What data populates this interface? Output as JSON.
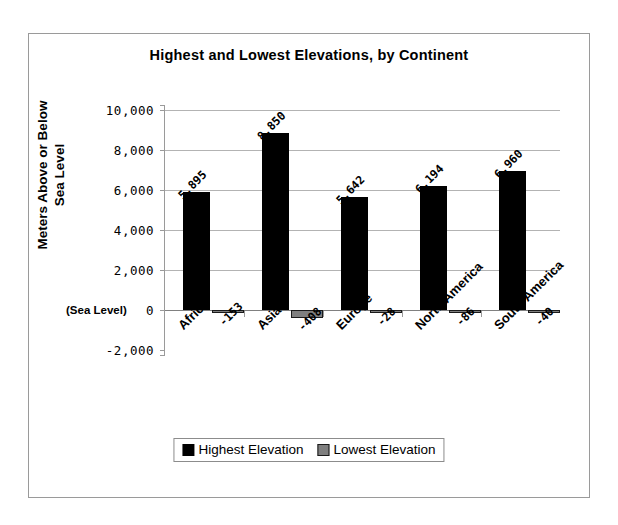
{
  "chart_data": {
    "type": "bar",
    "title": "Highest and Lowest Elevations, by Continent",
    "xlabel": "",
    "ylabel": "Meters Above or Below Sea Level",
    "categories": [
      "Africa",
      "Asia",
      "Europe",
      "North America",
      "South America"
    ],
    "series": [
      {
        "name": "Highest Elevation",
        "color": "#000000",
        "values": [
          5895,
          8850,
          5642,
          6194,
          6960
        ],
        "labels": [
          "5,895",
          "8,850",
          "5,642",
          "6,194",
          "6,960"
        ]
      },
      {
        "name": "Lowest Elevation",
        "color": "#7f7f7f",
        "values": [
          -153,
          -408,
          -28,
          -86,
          -40
        ],
        "labels": [
          "-153",
          "-408",
          "-28",
          "-86",
          "-40"
        ]
      }
    ],
    "ylim": [
      -2000,
      10000
    ],
    "ytick_values": [
      10000,
      8000,
      6000,
      4000,
      2000,
      0,
      -2000
    ],
    "ytick_labels": [
      "10,000",
      "8,000",
      "6,000",
      "4,000",
      "2,000",
      "0",
      "-2,000"
    ],
    "zero_annotation": "(Sea Level)",
    "grid": true,
    "legend_position": "bottom"
  },
  "legend": {
    "items": [
      {
        "label": "Highest Elevation",
        "swatch": "black-square"
      },
      {
        "label": "Lowest Elevation",
        "swatch": "gray-square"
      }
    ]
  }
}
